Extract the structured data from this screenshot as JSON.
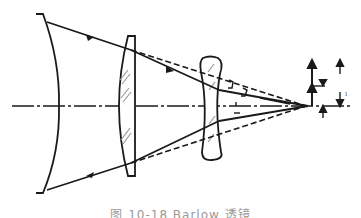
{
  "figure": {
    "type": "optical-ray-diagram",
    "caption": "图 10-18  Barlow 透镜",
    "colors": {
      "line": "#1a1a1a",
      "hatch": "#888888",
      "background": "#ffffff"
    }
  },
  "elements": {
    "primary_mirror": {
      "label": "concave mirror / objective surface"
    },
    "objective_lens": {
      "label": "positive objective lens"
    },
    "barlow_lens": {
      "label": "negative Barlow lens"
    },
    "optical_axis": {
      "label": "optical axis"
    },
    "focus_point": {
      "label": "focal point"
    },
    "image_arrows": {
      "labels": [
        "y'",
        "y"
      ]
    }
  },
  "annotations": {
    "image_height_label": "y'",
    "small_label": "ı"
  }
}
